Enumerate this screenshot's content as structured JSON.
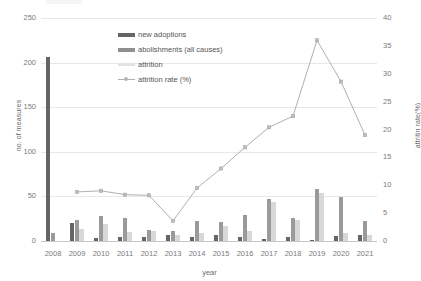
{
  "chart_data": {
    "type": "bar",
    "title": "",
    "xlabel": "year",
    "ylabel": "no. of measures",
    "y2label": "attritin rate(%)",
    "categories": [
      "2008",
      "2009",
      "2010",
      "2011",
      "2012",
      "2013",
      "2014",
      "2015",
      "2016",
      "2017",
      "2018",
      "2019",
      "2020",
      "2021"
    ],
    "ylim": [
      0,
      250
    ],
    "y2lim": [
      0,
      40
    ],
    "yticks": [
      "0",
      "50",
      "100",
      "150",
      "200",
      "250"
    ],
    "y2ticks": [
      "0",
      "5",
      "10",
      "15",
      "20",
      "25",
      "30",
      "35",
      "40"
    ],
    "grid": true,
    "legend_position": "inside-top-center",
    "series": [
      {
        "name": "new adoptions",
        "type": "bar",
        "axis": "left",
        "color": "#656565",
        "values": [
          206,
          20,
          3,
          5,
          5,
          7,
          4,
          7,
          5,
          2,
          4,
          1,
          6,
          7
        ]
      },
      {
        "name": "abolishments (all causes)",
        "type": "bar",
        "axis": "left",
        "color": "#9a9a9a",
        "values": [
          9,
          23,
          28,
          26,
          12,
          11,
          22,
          21,
          29,
          47,
          26,
          58,
          49,
          22
        ]
      },
      {
        "name": "attrition",
        "type": "bar",
        "axis": "left",
        "color": "#d8d8d8",
        "values": [
          0,
          14,
          19,
          10,
          11,
          7,
          9,
          17,
          11,
          44,
          24,
          54,
          9,
          7
        ]
      },
      {
        "name": "attrition rate (%)",
        "type": "line",
        "axis": "right",
        "color": "#b0b0b0",
        "values": [
          null,
          8.8,
          9.0,
          8.3,
          8.2,
          3.6,
          9.5,
          13.0,
          16.8,
          20.4,
          22.4,
          36.0,
          28.6,
          19.0
        ]
      }
    ]
  }
}
